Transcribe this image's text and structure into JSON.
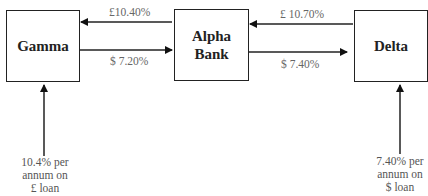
{
  "nodes": {
    "gamma": {
      "label": "Gamma"
    },
    "alpha": {
      "label_line1": "Alpha",
      "label_line2": "Bank"
    },
    "delta": {
      "label": "Delta"
    }
  },
  "edges": {
    "alpha_to_gamma": {
      "label": "£10.40%"
    },
    "gamma_to_alpha": {
      "label": "$ 7.20%"
    },
    "delta_to_alpha": {
      "label": "£ 10.70%"
    },
    "alpha_to_delta": {
      "label": "$ 7.40%"
    }
  },
  "notes": {
    "gamma": {
      "line1": "10.4% per",
      "line2": "annum on",
      "line3": "£ loan"
    },
    "delta": {
      "line1": "7.40% per",
      "line2": "annum on",
      "line3": "$ loan"
    }
  }
}
